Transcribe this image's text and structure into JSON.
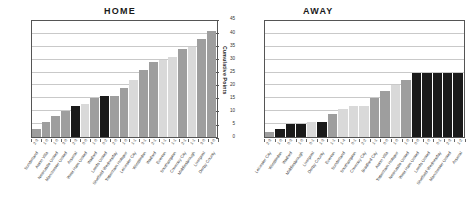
{
  "yaxis_title": "Cumulative Points",
  "charts": [
    {
      "id": "home",
      "title": "HOME",
      "ylim": [
        0,
        45
      ],
      "yticks": [
        0,
        5,
        10,
        15,
        20,
        25,
        30,
        35,
        40,
        45
      ],
      "grid": true
    },
    {
      "id": "away",
      "title": "AWAY",
      "ylim": [
        0,
        45
      ],
      "yticks": [
        0,
        5,
        10,
        15,
        20,
        25,
        30,
        35,
        40,
        45
      ],
      "grid": true
    }
  ],
  "chart_data": [
    {
      "type": "bar",
      "id": "home",
      "title": "HOME",
      "xlabel": "",
      "ylabel": "Cumulative Points",
      "ylim": [
        0,
        45
      ],
      "yticks": [
        0,
        5,
        10,
        15,
        20,
        25,
        30,
        35,
        40,
        45
      ],
      "grid": true,
      "legend": "none",
      "categories": [
        "Sunderland",
        "Aston Villa",
        "Newcastle United",
        "Manchester United",
        "Arsenal",
        "West Ham United",
        "Watford",
        "Leeds United",
        "Sheffield Wednesday",
        "Tottenham Hotspur",
        "Leicester City",
        "Wimbledon",
        "Watford",
        "Everton",
        "Southampton",
        "Coventry City",
        "Middlesbrough",
        "Liverpool",
        "Derby County"
      ],
      "scores": [
        "2-3",
        "1-0",
        "1-0",
        "3-0",
        "2-3",
        "0-0",
        "1-0",
        "0-2",
        "2-0",
        "1-0",
        "1-1",
        "3-1",
        "2-1",
        "1-1",
        "1-1",
        "2-1",
        "1-1",
        "3-0",
        "4-0"
      ],
      "values": [
        3,
        6,
        8,
        10,
        12,
        13,
        15,
        16,
        16,
        19,
        22,
        26,
        29,
        30,
        31,
        34,
        35,
        38,
        41
      ],
      "bar_colors": [
        "#9e9e9e",
        "#9e9e9e",
        "#9e9e9e",
        "#9e9e9e",
        "#1a1a1a",
        "#d9d9d9",
        "#9e9e9e",
        "#1a1a1a",
        "#9e9e9e",
        "#9e9e9e",
        "#d9d9d9",
        "#9e9e9e",
        "#9e9e9e",
        "#d9d9d9",
        "#d9d9d9",
        "#9e9e9e",
        "#d9d9d9",
        "#9e9e9e",
        "#9e9e9e"
      ]
    },
    {
      "type": "bar",
      "id": "away",
      "title": "AWAY",
      "xlabel": "",
      "ylabel": "Cumulative Points",
      "ylim": [
        0,
        45
      ],
      "yticks": [
        0,
        5,
        10,
        15,
        20,
        25,
        30,
        35,
        40,
        45
      ],
      "grid": true,
      "legend": "none",
      "categories": [
        "Leicester City",
        "Wimbledon",
        "Watford",
        "Middlesbrough",
        "Liverpool",
        "Derby County",
        "Everton",
        "Sunderland",
        "Southampton",
        "Coventry City",
        "Bradford City",
        "Aston Villa",
        "Tottenham Hotspur",
        "Newcastle United",
        "West Ham United",
        "Leeds United",
        "Sheffield Wednesday",
        "Manchester United",
        "Arsenal"
      ],
      "scores": [
        "2-3",
        "1-0",
        "0-3",
        "1-0",
        "0-1",
        "1-3",
        "1-1",
        "1-4",
        "0-1",
        "2-2",
        "1-1",
        "0-0",
        "1-0",
        "1-0",
        "0-0",
        "1-0",
        "0-1",
        "2-3",
        "1-2"
      ],
      "values": [
        2,
        3,
        5,
        5,
        6,
        6,
        9,
        11,
        12,
        12,
        15,
        18,
        20,
        22,
        25,
        25,
        25,
        25,
        25
      ],
      "bar_colors": [
        "#9e9e9e",
        "#1a1a1a",
        "#1a1a1a",
        "#1a1a1a",
        "#d9d9d9",
        "#1a1a1a",
        "#9e9e9e",
        "#d9d9d9",
        "#d9d9d9",
        "#d9d9d9",
        "#9e9e9e",
        "#9e9e9e",
        "#d9d9d9",
        "#9e9e9e",
        "#1a1a1a",
        "#1a1a1a",
        "#1a1a1a",
        "#1a1a1a",
        "#1a1a1a"
      ]
    }
  ]
}
